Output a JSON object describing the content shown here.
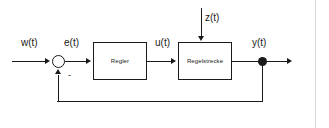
{
  "diagram": {
    "type": "control-loop-block-diagram",
    "background_color": "#ffffff",
    "line_color": "#1a1a1a",
    "border_color": "#d9d9d9",
    "blocks": [
      {
        "id": "controller",
        "label": "Regler"
      },
      {
        "id": "plant",
        "label": "Regelstrecke"
      }
    ],
    "signals": {
      "reference": "w(t)",
      "error": "e(t)",
      "control": "u(t)",
      "disturbance": "z(t)",
      "output": "y(t)"
    },
    "summing_junction": {
      "name": "summing-junction",
      "negative_sign": "-"
    }
  }
}
